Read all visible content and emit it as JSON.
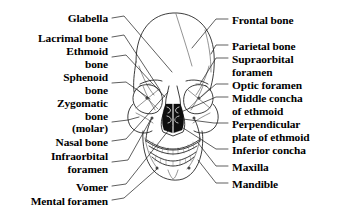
{
  "figure": {
    "background_color": "#ffffff",
    "ink_color": "#1a1a1a",
    "width": 342,
    "height": 219
  },
  "labels_left": [
    {
      "id": "glabella",
      "text": "Glabella",
      "x_right": 108,
      "y": 12
    },
    {
      "id": "lacrimal-bone",
      "text": "Lacrimal bone",
      "x_right": 108,
      "y": 32
    },
    {
      "id": "ethmoid-bone",
      "text": "Ethmoid\nbone",
      "x_right": 108,
      "y": 45
    },
    {
      "id": "sphenoid-bone",
      "text": "Sphenoid\nbone",
      "x_right": 108,
      "y": 71
    },
    {
      "id": "zygomatic-bone",
      "text": "Zygomatic\nbone\n(molar)",
      "x_right": 108,
      "y": 97
    },
    {
      "id": "nasal-bone",
      "text": "Nasal bone",
      "x_right": 108,
      "y": 136
    },
    {
      "id": "infraorbital-foramen",
      "text": "Infraorbital\nforamen",
      "x_right": 108,
      "y": 150
    },
    {
      "id": "vomer",
      "text": "Vomer",
      "x_right": 108,
      "y": 181
    },
    {
      "id": "mental-foramen",
      "text": "Mental foramen",
      "x_right": 108,
      "y": 195
    }
  ],
  "labels_right": [
    {
      "id": "frontal-bone",
      "text": "Frontal bone",
      "x_left": 232,
      "y": 14
    },
    {
      "id": "parietal-bone",
      "text": "Parietal bone",
      "x_left": 232,
      "y": 40
    },
    {
      "id": "supraorbital-foramen",
      "text": "Supraorbital\nforamen",
      "x_left": 232,
      "y": 53
    },
    {
      "id": "optic-foramen",
      "text": "Optic foramen",
      "x_left": 232,
      "y": 79
    },
    {
      "id": "middle-concha-of-ethmoid",
      "text": "Middle concha\nof ethmoid",
      "x_left": 232,
      "y": 92
    },
    {
      "id": "perpendicular-plate-of-ethmoid",
      "text": "Perpendicular\nplate of ethmoid",
      "x_left": 232,
      "y": 118
    },
    {
      "id": "inferior-concha",
      "text": "Inferior concha",
      "x_left": 232,
      "y": 144
    },
    {
      "id": "maxilla",
      "text": "Maxilla",
      "x_left": 232,
      "y": 161
    },
    {
      "id": "mandible",
      "text": "Mandible",
      "x_left": 232,
      "y": 178
    }
  ],
  "leader_lines": {
    "description": "Thin pointer strokes connecting each label to its anatomical structure on the skull",
    "count": 18
  }
}
